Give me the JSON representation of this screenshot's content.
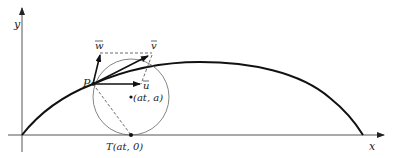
{
  "figure": {
    "type": "cycloid-velocity-diagram",
    "colors": {
      "background": "#ffffff",
      "stroke": "#111111",
      "axis": "#555555",
      "circle": "#666666",
      "dashed": "#444444"
    },
    "axes": {
      "x_label": "x",
      "y_label": "y"
    },
    "points": {
      "P": {
        "label": "P"
      },
      "center": {
        "label": "(at, a)"
      },
      "T": {
        "label": "T(at, 0)"
      }
    },
    "vectors": {
      "u": {
        "label": "u",
        "overline": true
      },
      "v": {
        "label": "v",
        "overline": true
      },
      "w": {
        "label": "w",
        "overline": true
      }
    },
    "curve": {
      "name": "cycloid arch"
    }
  }
}
